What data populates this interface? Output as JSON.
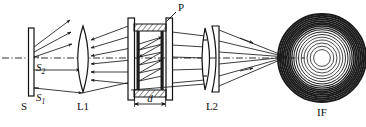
{
  "figure": {
    "kind": "optical-ray-diagram",
    "background_color": "#ffffff",
    "line_color": "#1a1a1a",
    "width": 366,
    "height": 127,
    "optical_axis_y": 58
  },
  "labels": {
    "source_plate": "S",
    "source_point_upper": "S",
    "source_point_upper_sub": "2",
    "source_point_lower": "S",
    "source_point_lower_sub": "1",
    "lens_one": "L1",
    "lens_two": "L2",
    "etalon_plate": "P",
    "gap_distance": "d",
    "fringe_pattern": "IF"
  },
  "components": [
    {
      "id": "source",
      "name": "extended-light-source",
      "label": "S",
      "x": 30,
      "type": "vertical-plate"
    },
    {
      "id": "lens1",
      "name": "collimating-lens",
      "label": "L1",
      "x": 83,
      "type": "biconvex-lens"
    },
    {
      "id": "etalon",
      "name": "fabry-perot-etalon",
      "label": "P",
      "x_left": 131,
      "x_right": 169,
      "type": "parallel-plate-etalon",
      "gap_label": "d"
    },
    {
      "id": "lens2",
      "name": "focusing-lens",
      "label": "L2",
      "x": 210,
      "type": "doublet-lens"
    },
    {
      "id": "fringes",
      "name": "interference-fringes",
      "label": "IF",
      "cx": 322,
      "cy": 58,
      "type": "concentric-ring-pattern",
      "ring_count": 17
    }
  ],
  "rings": {
    "center_x": 322,
    "center_y": 58,
    "radii": [
      44,
      42.2,
      40.4,
      38.6,
      36.9,
      35.2,
      33.6,
      32,
      30.2,
      28.2,
      26,
      23.5,
      20.8,
      18,
      15,
      11.8,
      8.4
    ],
    "widths": [
      2.0,
      2.0,
      1.9,
      1.9,
      1.8,
      1.7,
      1.6,
      1.5,
      1.3,
      1.1,
      1.0,
      0.9,
      0.8,
      0.8,
      0.8,
      0.8,
      0.8
    ]
  },
  "focus_point": {
    "x": 287,
    "y": 57
  }
}
